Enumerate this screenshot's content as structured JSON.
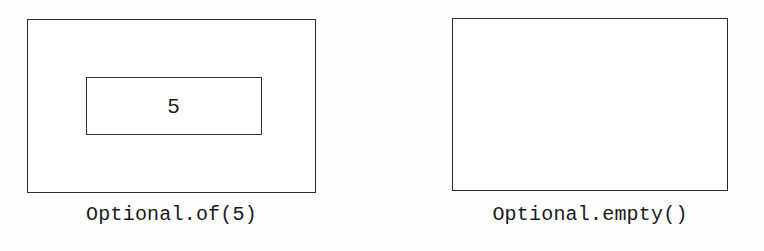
{
  "figure": {
    "background_color": "#ffffff",
    "line_color": "#2b2b2b",
    "text_color": "#1a1a1a"
  },
  "diagrams": [
    {
      "id": "optional-present",
      "caption": "Optional.of(5)",
      "container_label": "optional-container",
      "has_value": true,
      "value": "5"
    },
    {
      "id": "optional-empty",
      "caption": "Optional.empty()",
      "container_label": "optional-container",
      "has_value": false,
      "value": ""
    }
  ]
}
